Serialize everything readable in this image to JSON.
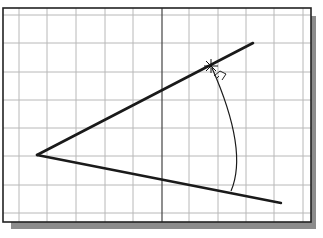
{
  "diagram": {
    "frame": {
      "x": 3,
      "y": 8,
      "w": 308,
      "h": 214,
      "border_color": "#222222",
      "shadow_color": "#8a8a8a"
    },
    "grid": {
      "color": "#b8b8b8",
      "vertical_lines_x": [
        19,
        47,
        76,
        105,
        133,
        189,
        218,
        246,
        274,
        303
      ],
      "horizontal_lines_y": [
        15,
        43,
        72,
        100,
        128,
        156,
        185,
        213
      ],
      "center_axis_x": 162,
      "center_axis_color": "#444444"
    },
    "vertex": {
      "x": 37,
      "y": 155
    },
    "line_upper_end": {
      "x": 253,
      "y": 43
    },
    "line_lower_end": {
      "x": 281,
      "y": 203
    },
    "arc": {
      "start": {
        "x": 212,
        "y": 68
      },
      "mid": {
        "x": 235,
        "y": 140
      },
      "end": {
        "x": 231,
        "y": 191
      }
    },
    "cursor_marker": {
      "x": 211,
      "y": 66,
      "icon": "crosshair-star-icon"
    },
    "angle_glyph": {
      "x": 220,
      "y": 74,
      "icon": "angle-snap-icon"
    },
    "stroke_color": "#1a1a1a"
  }
}
